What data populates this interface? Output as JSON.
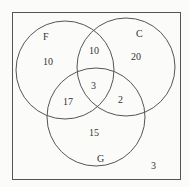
{
  "diagram": {
    "type": "venn",
    "sets": [
      {
        "name": "F",
        "label": "F"
      },
      {
        "name": "C",
        "label": "C"
      },
      {
        "name": "G",
        "label": "G"
      }
    ],
    "regions": {
      "F_only": "10",
      "C_only": "20",
      "G_only": "15",
      "F_and_C_only": "10",
      "F_and_G_only": "17",
      "C_and_G_only": "2",
      "F_and_C_and_G": "3",
      "outside": "3"
    },
    "colors": {
      "stroke": "#555555",
      "background": "#fbfbfa"
    }
  }
}
